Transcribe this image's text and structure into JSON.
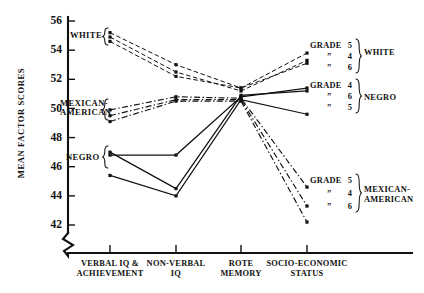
{
  "chart_data": {
    "type": "line",
    "title": "",
    "xlabel": "",
    "ylabel": "MEAN FACTOR SCORES",
    "ylim": [
      41.2,
      56.4
    ],
    "yticks": [
      42,
      44,
      46,
      48,
      50,
      52,
      54,
      56
    ],
    "ytick_labels": [
      "42",
      "44",
      "46",
      "48",
      "50",
      "52",
      "54",
      "56"
    ],
    "axis_break": true,
    "grid": false,
    "legend_position": "right",
    "categories": [
      "VERBAL IQ &\nACHIEVEMENT",
      "NON-VERBAL\nIQ",
      "ROTE\nMEMORY",
      "SOCIO-ECONOMIC\nSTATUS"
    ],
    "category_lines": [
      [
        "VERBAL IQ &",
        "ACHIEVEMENT"
      ],
      [
        "NON-VERBAL",
        "IQ"
      ],
      [
        "ROTE",
        "MEMORY"
      ],
      [
        "SOCIO-ECONOMIC",
        "STATUS"
      ]
    ],
    "series": [
      {
        "name": "White Grade 5",
        "group": "WHITE",
        "grade": "5",
        "style": "dashed",
        "values": [
          55.2,
          53.0,
          51.4,
          53.8
        ]
      },
      {
        "name": "White Grade 4",
        "group": "WHITE",
        "grade": "4",
        "style": "dashed",
        "values": [
          54.9,
          52.5,
          51.2,
          53.3
        ]
      },
      {
        "name": "White Grade 6",
        "group": "WHITE",
        "grade": "6",
        "style": "dashed",
        "values": [
          54.6,
          52.2,
          51.4,
          53.1
        ]
      },
      {
        "name": "Negro Grade 4",
        "group": "NEGRO",
        "grade": "4",
        "style": "solid",
        "values": [
          46.8,
          46.8,
          50.8,
          51.4
        ]
      },
      {
        "name": "Negro Grade 6",
        "group": "NEGRO",
        "grade": "6",
        "style": "solid",
        "values": [
          47.0,
          44.5,
          50.9,
          51.2
        ]
      },
      {
        "name": "Negro Grade 5",
        "group": "NEGRO",
        "grade": "5",
        "style": "solid",
        "values": [
          45.4,
          44.0,
          50.6,
          49.6
        ]
      },
      {
        "name": "Mexican-American Grade 5",
        "group": "MEXICAN-AMERICAN",
        "grade": "5",
        "style": "dashdot",
        "values": [
          49.9,
          50.8,
          50.7,
          44.6
        ]
      },
      {
        "name": "Mexican-American Grade 4",
        "group": "MEXICAN-AMERICAN",
        "grade": "4",
        "style": "dashdot",
        "values": [
          49.5,
          50.6,
          50.6,
          43.3
        ]
      },
      {
        "name": "Mexican-American Grade 6",
        "group": "MEXICAN-AMERICAN",
        "grade": "6",
        "style": "dashdot",
        "values": [
          49.1,
          50.5,
          50.5,
          42.2
        ]
      }
    ]
  },
  "axis": {
    "y_title": "MEAN FACTOR SCORES"
  },
  "left_labels": [
    {
      "id": "white",
      "text": "WHITE"
    },
    {
      "id": "mexican-american",
      "line1": "MEXICAN-",
      "line2": "AMERICAN"
    },
    {
      "id": "negro",
      "text": "NEGRO"
    }
  ],
  "legend": {
    "grade_word": "GRADE",
    "ditto": "ˮ",
    "blocks": [
      {
        "id": "white",
        "group": "WHITE",
        "rows": [
          {
            "label": "GRADE",
            "grade": "5"
          },
          {
            "label": "ˮ",
            "grade": "4"
          },
          {
            "label": "ˮ",
            "grade": "6"
          }
        ]
      },
      {
        "id": "negro",
        "group": "NEGRO",
        "rows": [
          {
            "label": "GRADE",
            "grade": "4"
          },
          {
            "label": "ˮ",
            "grade": "6"
          },
          {
            "label": "ˮ",
            "grade": "5"
          }
        ]
      },
      {
        "id": "mexican-american",
        "group_line1": "MEXICAN-",
        "group_line2": "AMERICAN",
        "rows": [
          {
            "label": "GRADE",
            "grade": "5"
          },
          {
            "label": "ˮ",
            "grade": "4"
          },
          {
            "label": "ˮ",
            "grade": "6"
          }
        ]
      }
    ]
  },
  "colors": {
    "ink": "#111111",
    "background": "#ffffff"
  }
}
